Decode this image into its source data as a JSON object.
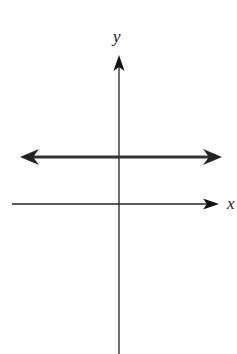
{
  "diagram": {
    "type": "coordinate-plane",
    "axes": {
      "x_label": "x",
      "y_label": "y"
    },
    "line": {
      "kind": "horizontal",
      "position": "above x-axis",
      "double_arrow": true
    },
    "colors": {
      "axis": "#222222",
      "line": "#333333",
      "background": "#ffffff"
    }
  }
}
